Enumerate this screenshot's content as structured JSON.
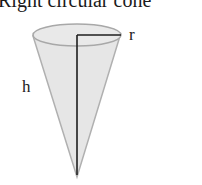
{
  "title": "Right circular cone",
  "labels": {
    "radius": "r",
    "height": "h"
  },
  "colors": {
    "fill": "#e6e6e6",
    "edge": "#a8a8a8",
    "line": "#1e1e1e"
  }
}
